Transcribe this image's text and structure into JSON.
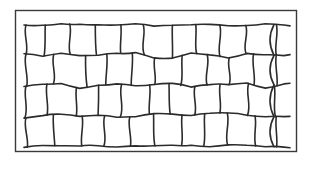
{
  "diagram": {
    "rows": 4,
    "cells_per_row": [
      10,
      10,
      10,
      10
    ],
    "right_edge": "open",
    "colors": {
      "background": "#ffffff",
      "line": "#2b2b2b",
      "frame": "#3a3a3a"
    }
  }
}
